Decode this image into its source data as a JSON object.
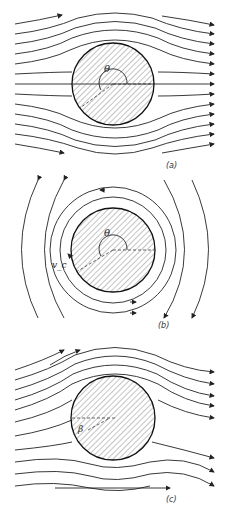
{
  "figure": {
    "panels": [
      {
        "id": "a",
        "caption": "(a)",
        "description": "Uniform flow past a circular cylinder",
        "angle_label": "θ"
      },
      {
        "id": "b",
        "caption": "(b)",
        "description": "Circulatory flow (vortex) around a circular cylinder",
        "angle_label": "θ",
        "velocity_label": "v_c"
      },
      {
        "id": "c",
        "caption": "(c)",
        "description": "Uniform flow plus circulation around a circular cylinder",
        "angle_label": "β"
      }
    ],
    "colors": {
      "line": "#222222",
      "background": "#ffffff"
    }
  }
}
